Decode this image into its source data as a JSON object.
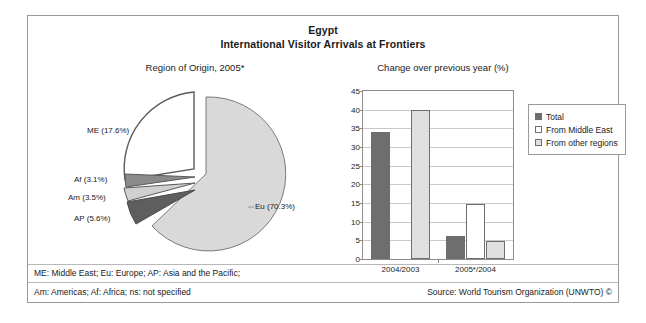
{
  "figure": {
    "title_main": "Egypt",
    "title_sub": "International Visitor Arrivals at Frontiers",
    "footnote_line1": "ME: Middle East; Eu: Europe; AP: Asia and the Pacific;",
    "footnote_line2": "Am: Americas; Af: Africa; ns: not specified",
    "source": "Source: World Tourism Organization (UNWTO) ©"
  },
  "chart_data": [
    {
      "type": "pie",
      "title": "Region of Origin, 2005*",
      "labels": [
        "Eu",
        "ME",
        "AP",
        "Am",
        "Af"
      ],
      "values": [
        70.3,
        17.6,
        5.6,
        3.5,
        3.1
      ],
      "value_unit": "%",
      "data_labels": [
        "Eu (70.3%)",
        "ME (17.6%)",
        "AP (5.6%)",
        "Am (3.5%)",
        "Af (3.1%)"
      ],
      "colors": [
        "#d9d9d9",
        "#ffffff",
        "#5e5e5e",
        "#d0d0d0",
        "#8a8a8a"
      ],
      "exploded": [
        "ME",
        "AP",
        "Am",
        "Af"
      ],
      "legend": "none"
    },
    {
      "type": "bar",
      "title": "Change over previous year (%)",
      "categories": [
        "2004/2003",
        "2005*/2004"
      ],
      "series": [
        {
          "name": "Total",
          "values": [
            34.0,
            6.2
          ],
          "color": "#6e6e6e"
        },
        {
          "name": "From Middle East",
          "values": [
            0.0,
            14.8
          ],
          "color": "#ffffff"
        },
        {
          "name": "From other regions",
          "values": [
            40.0,
            4.7
          ],
          "color": "#e0e0e0"
        }
      ],
      "ylabel": "",
      "xlabel": "",
      "ylim": [
        0,
        45
      ],
      "yticks": [
        45,
        40,
        35,
        30,
        25,
        20,
        15,
        10,
        5,
        0
      ],
      "grid": true,
      "legend_position": "right"
    }
  ]
}
